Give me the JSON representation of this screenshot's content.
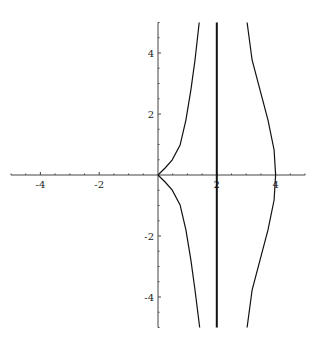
{
  "chart_data": {
    "type": "line",
    "title": "",
    "xlabel": "",
    "ylabel": "",
    "xlim": [
      -5,
      5
    ],
    "ylim": [
      -5,
      5
    ],
    "grid": false,
    "legend": null,
    "x_ticks": [
      -4,
      -2,
      2,
      4
    ],
    "x_tick_labels": [
      "-4",
      "-2",
      "2",
      "4"
    ],
    "y_ticks": [
      4,
      2,
      -2,
      -4
    ],
    "y_tick_labels": [
      "4",
      "2",
      "-2",
      "-4"
    ],
    "minor_tick_step": 0.5,
    "series": [
      {
        "name": "left-branch-upper",
        "points": [
          [
            0,
            0
          ],
          [
            0.24,
            0.23
          ],
          [
            0.48,
            0.49
          ],
          [
            0.75,
            0.98
          ],
          [
            0.95,
            1.8
          ],
          [
            1.12,
            2.79
          ],
          [
            1.26,
            3.77
          ],
          [
            1.4,
            5.0
          ]
        ]
      },
      {
        "name": "left-branch-lower",
        "points": [
          [
            0,
            0
          ],
          [
            0.24,
            -0.23
          ],
          [
            0.48,
            -0.49
          ],
          [
            0.75,
            -0.98
          ],
          [
            0.95,
            -1.8
          ],
          [
            1.12,
            -2.79
          ],
          [
            1.26,
            -3.77
          ],
          [
            1.42,
            -5.0
          ]
        ]
      },
      {
        "name": "vertical-line-x2",
        "points": [
          [
            2,
            -5
          ],
          [
            2,
            5
          ]
        ],
        "thick": true
      },
      {
        "name": "right-branch",
        "points": [
          [
            3.03,
            5.0
          ],
          [
            3.2,
            3.77
          ],
          [
            3.47,
            2.79
          ],
          [
            3.74,
            1.8
          ],
          [
            3.95,
            0.82
          ],
          [
            4.0,
            0
          ],
          [
            3.95,
            -0.82
          ],
          [
            3.74,
            -1.8
          ],
          [
            3.47,
            -2.79
          ],
          [
            3.2,
            -3.77
          ],
          [
            3.03,
            -5.0
          ]
        ]
      }
    ]
  }
}
